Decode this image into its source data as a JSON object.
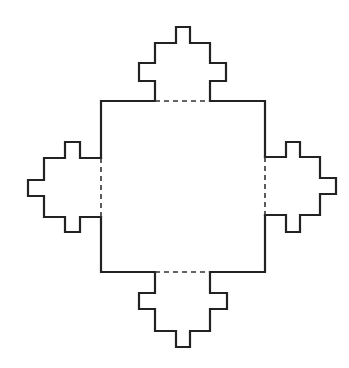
{
  "figure": {
    "colors": {
      "line": "#222222",
      "background": "#ffffff"
    },
    "square": {
      "x": 101,
      "y": 101,
      "width": 164,
      "height": 171
    },
    "bumps": [
      {
        "side": "top",
        "points": "155,101 155,81 139,81 139,63 155,63 155,43 176,43 176,27 190,27 190,43 210,43 210,63 226,63 226,81 210,81 210,101",
        "dash": "155,101 210,101"
      },
      {
        "side": "bottom",
        "points": "155,272 155,293 139,293 139,309 155,309 155,331 176,331 176,347 190,347 190,331 210,331 210,309 227,309 227,293 210,293 210,272",
        "dash": "155,272 210,272"
      },
      {
        "side": "left",
        "points": "101,158 80,158 80,142 65,142 65,158 44,158 44,180 28,180 28,196 44,196 44,217 65,217 65,232 80,232 80,217 101,217",
        "dash": "101,158 101,217"
      },
      {
        "side": "right",
        "points": "265,157 286,157 286,142 300,142 300,157 320,157 320,178 336,178 336,194 320,194 320,215 300,215 300,232 286,232 286,215 265,215",
        "dash": "265,157 265,215"
      }
    ]
  }
}
